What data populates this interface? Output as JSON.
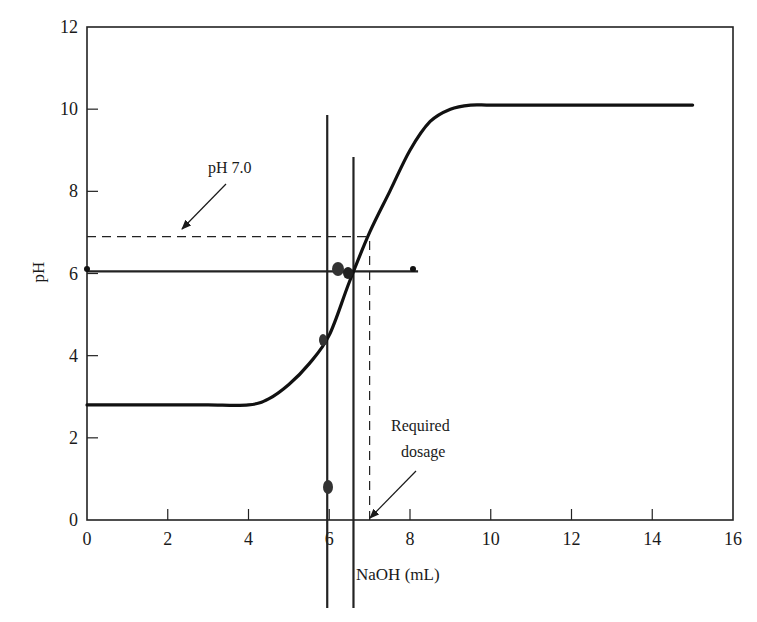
{
  "chart_data": {
    "type": "line",
    "title": "",
    "xlabel": "NaOH (mL)",
    "ylabel": "pH",
    "xlim": [
      0,
      16
    ],
    "ylim": [
      0,
      12
    ],
    "grid": false,
    "legend": null,
    "x_ticks": [
      0,
      2,
      4,
      6,
      8,
      10,
      12,
      14,
      16
    ],
    "y_ticks": [
      0,
      2,
      4,
      6,
      8,
      10,
      12
    ],
    "x_tick_labels": [
      "0",
      "2",
      "4",
      "6",
      "8",
      "10",
      "12",
      "14",
      "16"
    ],
    "y_tick_labels": [
      "0",
      "2",
      "4",
      "6",
      "8",
      "10",
      "12"
    ],
    "series": [
      {
        "name": "Titration curve",
        "x": [
          0,
          1,
          2,
          3,
          4,
          4.5,
          5,
          5.5,
          6,
          6.5,
          7,
          7.5,
          8,
          8.5,
          9,
          9.5,
          10,
          11,
          12,
          13,
          14,
          15
        ],
        "y": [
          2.8,
          2.8,
          2.8,
          2.8,
          2.8,
          2.95,
          3.3,
          3.8,
          4.5,
          5.8,
          7.0,
          8.0,
          9.0,
          9.7,
          10.0,
          10.1,
          10.1,
          10.1,
          10.1,
          10.1,
          10.1,
          10.1
        ]
      }
    ],
    "reference_lines": [
      {
        "name": "pH 7.0 dashed",
        "orientation": "horizontal",
        "y": 6.9,
        "x_range": [
          0,
          7.0
        ],
        "style": "dashed"
      },
      {
        "name": "Required dosage dashed",
        "orientation": "vertical",
        "x": 7.0,
        "y_range": [
          0,
          6.9
        ],
        "style": "dashed"
      },
      {
        "name": "Horizontal solid at pH 6",
        "orientation": "horizontal",
        "y": 6.05,
        "x_range": [
          0,
          8.2
        ],
        "style": "solid"
      },
      {
        "name": "Vertical solid line A",
        "orientation": "vertical",
        "x": 5.95,
        "style": "solid"
      },
      {
        "name": "Vertical solid line B",
        "orientation": "vertical",
        "x": 6.6,
        "style": "solid"
      }
    ],
    "annotations": [
      {
        "text": "pH 7.0",
        "points_to": {
          "x": 2.3,
          "y": 6.9
        }
      },
      {
        "text": "Required dosage",
        "line1": "Required",
        "line2": "dosage",
        "points_to": {
          "x": 7.0,
          "y": 0
        }
      }
    ]
  }
}
